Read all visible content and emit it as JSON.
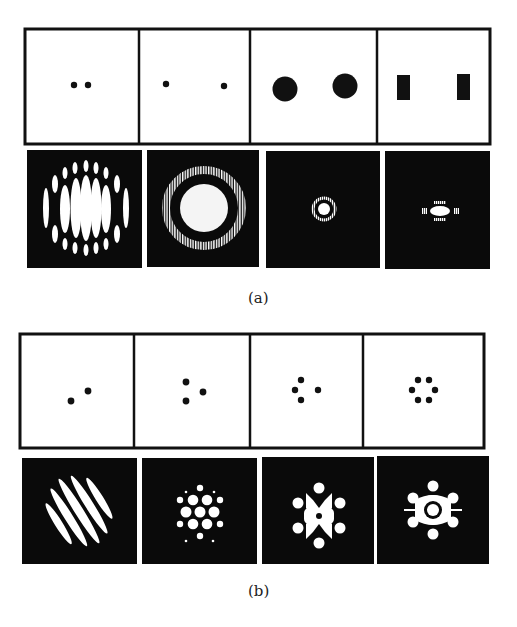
{
  "figure": {
    "part_a": {
      "label": "(a)",
      "apertures": [
        {
          "name": "two-small-holes-close",
          "shape": "two small dots, close together"
        },
        {
          "name": "two-small-holes-far",
          "shape": "two small dots, far apart"
        },
        {
          "name": "two-large-circular-holes",
          "shape": "two large circles"
        },
        {
          "name": "two-rectangular-slits",
          "shape": "two vertical rectangles"
        }
      ],
      "patterns": [
        {
          "name": "ring-fringes-wide",
          "description": "broad Airy disk crossed by vertical fringes with surrounding ring of spots"
        },
        {
          "name": "ring-fringes-fine",
          "description": "Airy disk with ring, both crossed by fine vertical fringes"
        },
        {
          "name": "small-airy-disk",
          "description": "small central disk with faint fringed ring"
        },
        {
          "name": "elongated-slit-pattern",
          "description": "horizontally elongated central spot with side lobes"
        }
      ]
    },
    "part_b": {
      "label": "(b)",
      "apertures": [
        {
          "name": "two-holes-diagonal",
          "shape": "two dots on a diagonal"
        },
        {
          "name": "three-holes",
          "shape": "three dots in triangle"
        },
        {
          "name": "four-holes",
          "shape": "four dots in diamond"
        },
        {
          "name": "six-holes-ring",
          "shape": "six dots in hexagonal ring"
        }
      ],
      "patterns": [
        {
          "name": "diagonal-fringes",
          "description": "tilted parallel elongated fringes"
        },
        {
          "name": "hexagonal-spot-array",
          "description": "hexagonal lattice of bright spots"
        },
        {
          "name": "four-hole-pattern",
          "description": "interconnected lattice of blobs"
        },
        {
          "name": "six-hole-pattern",
          "description": "central ring surrounded by six spots"
        }
      ]
    }
  }
}
